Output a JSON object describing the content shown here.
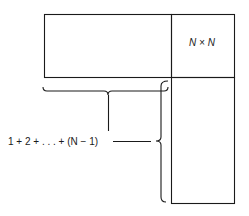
{
  "diagram": {
    "square_label": "N × N",
    "sum_label": "1 + 2 + . . . + (N − 1)",
    "colors": {
      "stroke": "#1a1a1a",
      "background": "#ffffff"
    }
  }
}
